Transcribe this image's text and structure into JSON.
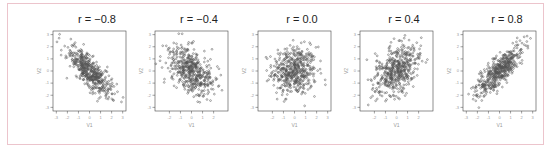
{
  "chart_data": [
    {
      "type": "scatter",
      "title": "r = −0.8",
      "r": -0.8,
      "n": 500,
      "xlabel": "V1",
      "ylabel": "V2",
      "xticks": [
        "-3",
        "-2",
        "-1",
        "0",
        "1",
        "2",
        "3"
      ],
      "yticks": [
        "-3",
        "-2",
        "-1",
        "0",
        "1",
        "2",
        "3"
      ],
      "xlim": [
        -3.3,
        3.3
      ],
      "ylim": [
        -3.3,
        3.3
      ]
    },
    {
      "type": "scatter",
      "title": "r = −0.4",
      "r": -0.4,
      "n": 500,
      "xlabel": "V1",
      "ylabel": "V2",
      "xticks": [
        "-2",
        "-1",
        "0",
        "1",
        "2"
      ],
      "yticks": [
        "-3",
        "-2",
        "-1",
        "0",
        "1",
        "2",
        "3"
      ],
      "xlim": [
        -3.3,
        3.3
      ],
      "ylim": [
        -3.3,
        3.3
      ]
    },
    {
      "type": "scatter",
      "title": "r = 0.0",
      "r": 0.0,
      "n": 500,
      "xlabel": "V1",
      "ylabel": "V2",
      "xticks": [
        "-2",
        "-1",
        "0",
        "1",
        "2",
        "3"
      ],
      "yticks": [
        "-3",
        "-2",
        "-1",
        "0",
        "1",
        "2",
        "3"
      ],
      "xlim": [
        -3.3,
        3.3
      ],
      "ylim": [
        -3.3,
        3.3
      ]
    },
    {
      "type": "scatter",
      "title": "r = 0.4",
      "r": 0.4,
      "n": 500,
      "xlabel": "V1",
      "ylabel": "V2",
      "xticks": [
        "-2",
        "-1",
        "0",
        "1",
        "2"
      ],
      "yticks": [
        "-3",
        "-2",
        "-1",
        "0",
        "1",
        "2",
        "3"
      ],
      "xlim": [
        -3.3,
        3.3
      ],
      "ylim": [
        -3.3,
        3.3
      ]
    },
    {
      "type": "scatter",
      "title": "r = 0.8",
      "r": 0.8,
      "n": 500,
      "xlabel": "V1",
      "ylabel": "V2",
      "xticks": [
        "-3",
        "-2",
        "-1",
        "0",
        "1",
        "2",
        "3"
      ],
      "yticks": [
        "-3",
        "-2",
        "-1",
        "0",
        "1",
        "2",
        "3"
      ],
      "xlim": [
        -3.3,
        3.3
      ],
      "ylim": [
        -3.3,
        3.3
      ]
    }
  ],
  "style": {
    "frame_border": "#ecc4cc",
    "point_color": "#555555",
    "axis_color": "#444444",
    "tick_label_color": "#9a9a9a"
  }
}
